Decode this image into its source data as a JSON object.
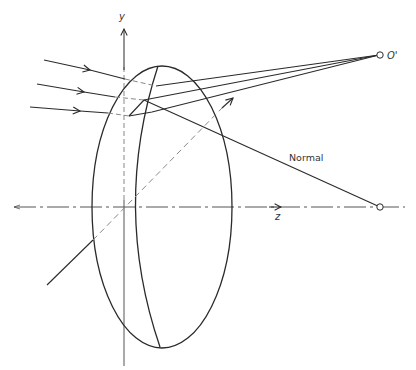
{
  "diagram": {
    "colors": {
      "line": "#2a2a2a",
      "axis": "#555555",
      "dashed": "#888888",
      "background": "#ffffff"
    },
    "labels": {
      "y_axis": "y",
      "z_axis": "z",
      "image_point": "O'",
      "normal": "Normal"
    },
    "label_positions": {
      "y_axis": [
        119,
        20
      ],
      "z_axis": [
        275,
        220
      ],
      "image_point": [
        387,
        59
      ],
      "normal": [
        289,
        161
      ]
    },
    "axes": {
      "y": {
        "x": 124,
        "y_top": 29,
        "y_bottom": 366
      },
      "z": {
        "y": 207,
        "x_left": 14,
        "x_right": 405,
        "arrow_x": 281
      }
    },
    "lens": {
      "outer_ellipse": {
        "cx": 162,
        "cy": 207,
        "rx": 70,
        "ry": 141
      },
      "inner_edge_path": "M158,66 Q112,207 160,347"
    },
    "diagonal_axis": {
      "solid_start": [
        47,
        285
      ],
      "ellipse_hit": [
        93,
        240
      ],
      "dashed_end": [
        222,
        108
      ],
      "arrow_tip": [
        233,
        98
      ]
    },
    "incident_rays": [
      {
        "start": [
          44,
          60
        ],
        "arrow": [
          90,
          70
        ],
        "hit": [
          125,
          79
        ],
        "inner": [
          156,
          86
        ]
      },
      {
        "start": [
          37,
          84
        ],
        "arrow": [
          84,
          92
        ],
        "hit": [
          115,
          97
        ],
        "inner": [
          144,
          100
        ]
      },
      {
        "start": [
          30,
          107
        ],
        "arrow": [
          80,
          111
        ],
        "hit": [
          108,
          113
        ],
        "inner": [
          129,
          116
        ]
      }
    ],
    "refracted_rays": [
      {
        "points": [
          [
            156,
            86
          ],
          [
            379,
            55
          ]
        ]
      },
      {
        "points": [
          [
            144,
            100
          ],
          [
            379,
            55
          ]
        ]
      },
      {
        "points": [
          [
            129,
            116
          ],
          [
            144,
            100
          ]
        ]
      },
      {
        "points": [
          [
            129,
            116
          ],
          [
            152,
            112
          ],
          [
            379,
            55
          ]
        ]
      }
    ],
    "normal_line": {
      "start": [
        144,
        100
      ],
      "end": [
        380,
        207
      ]
    },
    "points": {
      "image_point": {
        "x": 380,
        "y": 55,
        "r": 3.2
      },
      "center_of_curvature": {
        "x": 380,
        "y": 207,
        "r": 3.2
      }
    }
  }
}
